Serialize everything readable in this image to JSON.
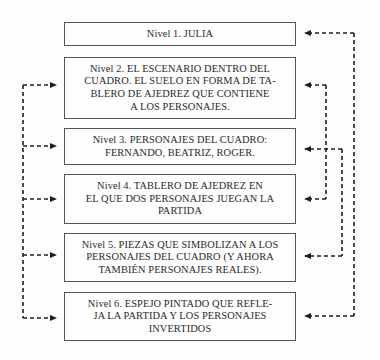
{
  "diagram": {
    "type": "flow-levels",
    "levels": [
      {
        "id": 1,
        "label": "Nivel 1. JULIA"
      },
      {
        "id": 2,
        "label": "Nivel 2. EL ESCENARIO DENTRO DEL CUADRO. EL SUELO EN FORMA DE TABLERO DE AJEDREZ QUE CONTIENE A LOS PERSONAJES.",
        "lines": [
          "Nivel 2. EL ESCENARIO DENTRO DEL",
          "CUADRO. EL SUELO EN FORMA DE TA-",
          "BLERO DE AJEDREZ QUE CONTIENE",
          "A LOS PERSONAJES."
        ]
      },
      {
        "id": 3,
        "label": "Nivel 3. PERSONAJES DEL CUADRO: FERNANDO, BEATRIZ, ROGER.",
        "lines": [
          "Nivel 3. PERSONAJES DEL CUADRO:",
          "FERNANDO, BEATRIZ, ROGER."
        ]
      },
      {
        "id": 4,
        "label": "Nivel 4. TABLERO DE AJEDREZ EN EL QUE DOS PERSONAJES JUEGAN LA PARTIDA",
        "lines": [
          "Nivel 4. TABLERO DE AJEDREZ EN",
          "EL QUE DOS PERSONAJES JUEGAN LA",
          "PARTIDA"
        ]
      },
      {
        "id": 5,
        "label": "Nivel 5. PIEZAS QUE SIMBOLIZAN A LOS PERSONAJES DEL CUADRO (Y AHORA TAMBIÉN PERSONAJES REALES).",
        "lines": [
          "Nivel 5. PIEZAS QUE SIMBOLIZAN A LOS",
          "PERSONAJES DEL CUADRO (Y AHORA",
          "TAMBIÉN PERSONAJES REALES)."
        ]
      },
      {
        "id": 6,
        "label": "Nivel 6. ESPEJO PINTADO QUE REFLEJA LA PARTIDA Y LOS PERSONAJES INVERTIDOS",
        "lines": [
          "Nivel 6. ESPEJO PINTADO QUE REFLE-",
          "JA LA PARTIDA Y LOS PERSONAJES",
          "INVERTIDOS"
        ]
      }
    ],
    "connectors": {
      "left_bus": {
        "targets": [
          2,
          3,
          4,
          5,
          6
        ],
        "style": "dashed",
        "arrowheads": "right"
      },
      "right_links": [
        {
          "from": 1,
          "to": 6,
          "style": "dashed",
          "arrowheads": "both-left"
        },
        {
          "from": 2,
          "to": 4,
          "style": "dashed",
          "arrowheads": "both-left"
        },
        {
          "from": 3,
          "to": 5,
          "style": "dashed",
          "arrowheads": "both-left"
        }
      ]
    },
    "colors": {
      "line": "#1e1e1e",
      "box_border": "#555555",
      "text": "#2a2a2a",
      "background": "#fdfdfb"
    }
  }
}
